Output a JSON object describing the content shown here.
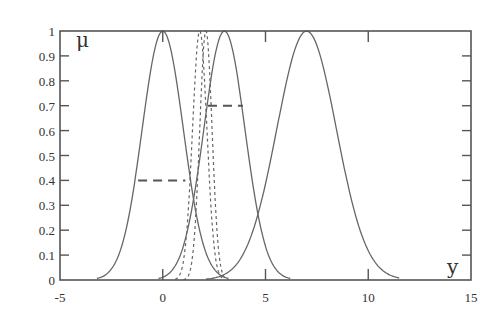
{
  "chart_data": {
    "type": "line",
    "title": "",
    "xlabel": "y",
    "ylabel": "μ",
    "xlim": [
      -5,
      15
    ],
    "ylim": [
      0,
      1
    ],
    "x_ticks": [
      "-5",
      "0",
      "5",
      "10",
      "15"
    ],
    "y_ticks": [
      "0",
      "0.1",
      "0.2",
      "0.3",
      "0.4",
      "0.5",
      "0.6",
      "0.7",
      "0.8",
      "0.9",
      "1"
    ],
    "grid": false,
    "legend": null,
    "series": [
      {
        "name": "gaussian-center-0",
        "style": "solid",
        "center": 0,
        "sigma": 1.0,
        "range": [
          -3.2,
          3.2
        ]
      },
      {
        "name": "gaussian-center-3",
        "style": "solid",
        "center": 3,
        "sigma": 1.0,
        "range": [
          -0.2,
          6.2
        ]
      },
      {
        "name": "gaussian-center-7",
        "style": "solid",
        "center": 7,
        "sigma": 1.45,
        "range": [
          2.1,
          11.5
        ]
      },
      {
        "name": "narrow-dashed-left",
        "style": "dotted",
        "center": 1.8,
        "sigma": 0.35,
        "range": [
          0.6,
          2.9
        ]
      },
      {
        "name": "narrow-dashed-right",
        "style": "dotted",
        "center": 2.1,
        "sigma": 0.3,
        "range": [
          1.0,
          3.2
        ]
      }
    ],
    "annotations": [
      {
        "type": "dashed-hline",
        "y": 0.4,
        "x_from": -1.2,
        "x_to": 1.1
      },
      {
        "type": "dashed-hline",
        "y": 0.7,
        "x_from": 2.2,
        "x_to": 3.9
      }
    ]
  },
  "labels": {
    "y_axis_symbol": "μ",
    "x_axis_symbol": "y"
  }
}
